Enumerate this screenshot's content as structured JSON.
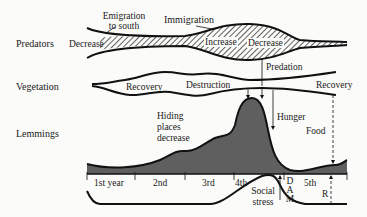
{
  "rows": {
    "predators": "Predators",
    "vegetation": "Vegetation",
    "lemmings": "Lemmings"
  },
  "predators": {
    "decrease_left": "Decrease",
    "emigration_line1": "Emigration",
    "emigration_line2": "to south",
    "immigration": "Immigration",
    "increase": "Increase",
    "decrease_right": "Decrease"
  },
  "vegetation": {
    "recovery_left": "Recovery",
    "destruction": "Destruction",
    "predation": "Predation",
    "recovery_right": "Recovery"
  },
  "lemmings": {
    "hiding_line1": "Hiding",
    "hiding_line2": "places",
    "hiding_line3": "decrease",
    "hunger": "Hunger",
    "food": "Food"
  },
  "timeline": {
    "years": [
      "1st year",
      "2nd",
      "3rd",
      "4th",
      "5th"
    ],
    "dam": [
      "D",
      "A",
      "M"
    ],
    "r": "R",
    "social_line1": "Social",
    "social_line2": "stress"
  },
  "colors": {
    "fill": "#5f5f5f",
    "stroke": "#111111",
    "hatch": "#1a1a1a"
  }
}
